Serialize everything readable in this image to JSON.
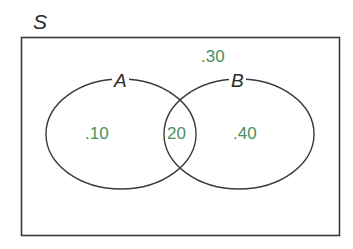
{
  "diagram": {
    "type": "venn",
    "universe_label": "S",
    "sets": [
      {
        "name": "A",
        "region_only_label": ".10",
        "region_only_value": 0.1
      },
      {
        "name": "B",
        "region_only_label": ".40",
        "region_only_value": 0.4
      }
    ],
    "intersection_label": "20",
    "intersection_value": 0.2,
    "outside_label": ".30",
    "outside_value": 0.3,
    "colors": {
      "outline": "#3a3a3a",
      "probability_text": "#4a8f5c",
      "background": "#ffffff"
    }
  }
}
